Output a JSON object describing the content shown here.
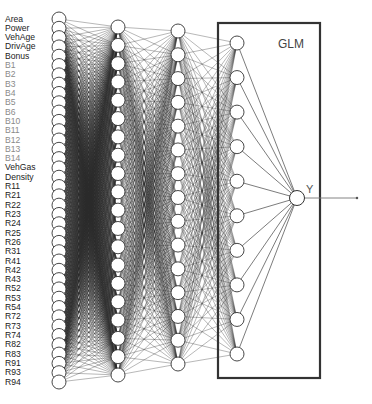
{
  "diagram": {
    "type": "neural-network-with-glm",
    "glm_box": {
      "label": "GLM",
      "x": 218,
      "y": 23,
      "width": 102,
      "height": 355
    },
    "output": {
      "label": "Y",
      "x": 297,
      "y": 198,
      "r": 7.5,
      "arrow_to_x": 357
    },
    "colors": {
      "node_fill": "#ffffff",
      "node_stroke": "#333333",
      "edge": "#2a2a2a",
      "glm_box": "#333333",
      "label_dark": "#222222",
      "label_light": "#8a8a8a"
    },
    "layers": [
      {
        "name": "input",
        "x": 59,
        "y_start": 19,
        "y_end": 382,
        "count": 40,
        "r": 7
      },
      {
        "name": "hidden-1",
        "x": 118,
        "y_start": 27,
        "y_end": 375,
        "count": 20,
        "r": 7
      },
      {
        "name": "hidden-2",
        "x": 178,
        "y_start": 31,
        "y_end": 364,
        "count": 15,
        "r": 7
      },
      {
        "name": "hidden-3",
        "x": 237,
        "y_start": 43,
        "y_end": 354,
        "count": 10,
        "r": 7
      }
    ],
    "input_labels": [
      {
        "text": "Area",
        "tone": "dark"
      },
      {
        "text": "Power",
        "tone": "dark"
      },
      {
        "text": "VehAge",
        "tone": "dark"
      },
      {
        "text": "DrivAge",
        "tone": "dark"
      },
      {
        "text": "Bonus",
        "tone": "dark"
      },
      {
        "text": "B1",
        "tone": "light"
      },
      {
        "text": "B2",
        "tone": "light"
      },
      {
        "text": "B3",
        "tone": "light"
      },
      {
        "text": "B4",
        "tone": "light"
      },
      {
        "text": "B5",
        "tone": "light"
      },
      {
        "text": "B6",
        "tone": "light"
      },
      {
        "text": "B10",
        "tone": "light"
      },
      {
        "text": "B11",
        "tone": "light"
      },
      {
        "text": "B12",
        "tone": "light"
      },
      {
        "text": "B13",
        "tone": "light"
      },
      {
        "text": "B14",
        "tone": "light"
      },
      {
        "text": "VehGas",
        "tone": "dark"
      },
      {
        "text": "Density",
        "tone": "dark"
      },
      {
        "text": "R11",
        "tone": "dark"
      },
      {
        "text": "R21",
        "tone": "dark"
      },
      {
        "text": "R22",
        "tone": "dark"
      },
      {
        "text": "R23",
        "tone": "dark"
      },
      {
        "text": "R24",
        "tone": "dark"
      },
      {
        "text": "R25",
        "tone": "dark"
      },
      {
        "text": "R26",
        "tone": "dark"
      },
      {
        "text": "R31",
        "tone": "dark"
      },
      {
        "text": "R41",
        "tone": "dark"
      },
      {
        "text": "R42",
        "tone": "dark"
      },
      {
        "text": "R43",
        "tone": "dark"
      },
      {
        "text": "R52",
        "tone": "dark"
      },
      {
        "text": "R53",
        "tone": "dark"
      },
      {
        "text": "R54",
        "tone": "dark"
      },
      {
        "text": "R72",
        "tone": "dark"
      },
      {
        "text": "R73",
        "tone": "dark"
      },
      {
        "text": "R74",
        "tone": "dark"
      },
      {
        "text": "R82",
        "tone": "dark"
      },
      {
        "text": "R83",
        "tone": "dark"
      },
      {
        "text": "R91",
        "tone": "dark"
      },
      {
        "text": "R93",
        "tone": "dark"
      },
      {
        "text": "R94",
        "tone": "dark"
      }
    ]
  }
}
